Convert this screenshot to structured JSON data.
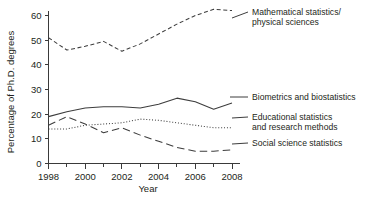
{
  "chart_data": {
    "type": "line",
    "title": "",
    "xlabel": "Year",
    "ylabel": "Percentage of Ph.D. degrees",
    "xlim": [
      1997.5,
      2008.6
    ],
    "ylim": [
      0,
      65
    ],
    "yticks": [
      0,
      10,
      20,
      30,
      40,
      50,
      60
    ],
    "ytick_labels": [
      "0",
      "10",
      "20",
      "30",
      "40",
      "50",
      "60"
    ],
    "xticks": [
      1998,
      1999,
      2000,
      2001,
      2002,
      2003,
      2004,
      2005,
      2006,
      2007,
      2008
    ],
    "xtick_labels": [
      "1998",
      "",
      "2000",
      "",
      "2002",
      "",
      "2004",
      "",
      "2006",
      "",
      "2008"
    ],
    "xtick_labels_shown": [
      "1998",
      "2000",
      "2002",
      "2004",
      "2006",
      "2008"
    ],
    "grid": false,
    "legend_position": "right-inline-labels",
    "x": [
      1998,
      1999,
      2000,
      2001,
      2002,
      2003,
      2004,
      2005,
      2006,
      2007,
      2008
    ],
    "series": [
      {
        "name": "Mathematical statistics/\nphysical sciences",
        "label_line1": "Mathematical statistics/",
        "label_line2": "physical sciences",
        "linestyle": "dashed",
        "color": "#3d3d3d",
        "values": [
          51,
          46,
          47.5,
          49.5,
          45.5,
          48.5,
          52.5,
          56.5,
          60,
          62.5,
          62
        ]
      },
      {
        "name": "Biometrics and biostatistics",
        "label_line1": "Biometrics and biostatistics",
        "label_line2": "",
        "linestyle": "solid",
        "color": "#3d3d3d",
        "values": [
          19,
          21,
          22.5,
          23,
          23,
          22.5,
          24,
          26.5,
          25,
          22,
          24.5
        ]
      },
      {
        "name": "Educational statistics\nand research methods",
        "label_line1": "Educational statistics",
        "label_line2": "and research methods",
        "linestyle": "dotted",
        "color": "#6b6b6b",
        "values": [
          14,
          14,
          15.5,
          16,
          16.5,
          18,
          17.5,
          16.5,
          15.5,
          14.5,
          14.5
        ]
      },
      {
        "name": "Social science statistics",
        "label_line1": "Social science statistics",
        "label_line2": "",
        "linestyle": "longdash",
        "color": "#3d3d3d",
        "values": [
          15.5,
          19,
          16,
          12.5,
          14.5,
          11.5,
          9,
          6.5,
          5,
          5,
          5.5
        ]
      }
    ]
  }
}
